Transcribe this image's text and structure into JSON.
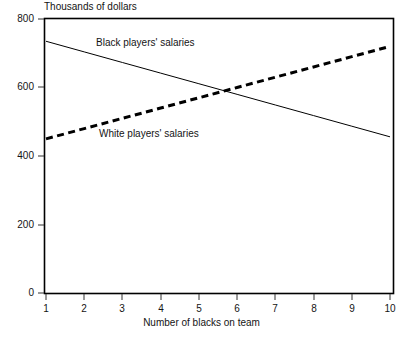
{
  "chart_data": {
    "type": "line",
    "title": "",
    "ylabel": "Thousands of dollars",
    "xlabel": "Number of blacks on team",
    "x": [
      1,
      2,
      3,
      4,
      5,
      6,
      7,
      8,
      9,
      10
    ],
    "xlim": [
      1,
      10
    ],
    "ylim": [
      0,
      800
    ],
    "yticks": [
      0,
      200,
      400,
      600,
      800
    ],
    "xticks": [
      1,
      2,
      3,
      4,
      5,
      6,
      7,
      8,
      9,
      10
    ],
    "grid": false,
    "legend_position": "inline-annotations",
    "series": [
      {
        "name": "Black players' salaries",
        "style": "solid",
        "color": "#000000",
        "line_width": 1,
        "values": [
          735,
          704,
          673,
          642,
          611,
          580,
          549,
          518,
          487,
          456
        ]
      },
      {
        "name": "White players' salaries",
        "style": "dashed",
        "color": "#000000",
        "line_width": 3,
        "values": [
          450,
          480,
          510,
          540,
          570,
          600,
          630,
          660,
          690,
          720
        ]
      }
    ],
    "annotations": [
      {
        "text": "Black players' salaries",
        "x": 2.4,
        "y": 700
      },
      {
        "text": "White players' salaries",
        "x": 2.5,
        "y": 440
      }
    ]
  },
  "axes": {
    "y_title": "Thousands of dollars",
    "x_title": "Number of blacks on team",
    "y_tick_labels": [
      "800",
      "600",
      "400",
      "200",
      "0"
    ],
    "x_tick_labels": [
      "1",
      "2",
      "3",
      "4",
      "5",
      "6",
      "7",
      "8",
      "9",
      "10"
    ]
  },
  "labels": {
    "black_series": "Black players' salaries",
    "white_series": "White players' salaries"
  },
  "footnote": {
    "text": ""
  },
  "colors": {
    "ink": "#000000",
    "background": "#ffffff",
    "text": "#141414"
  }
}
